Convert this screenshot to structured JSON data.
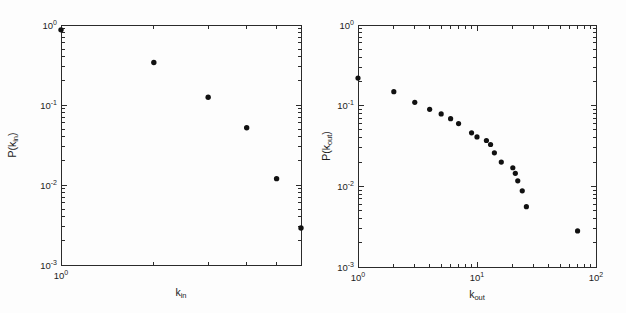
{
  "page": {
    "background": "#fdfdfd",
    "axis_color": "#2b2b2b",
    "text_color": "#1c1c1c"
  },
  "chart_data": [
    {
      "type": "scatter",
      "title": "",
      "xlabel": {
        "base": "k",
        "sub": "in"
      },
      "ylabel": {
        "pre": "P(k",
        "sub": "in",
        "post": ")"
      },
      "xscale": "log",
      "yscale": "log",
      "xlim": [
        1,
        6
      ],
      "ylim": [
        0.001,
        1
      ],
      "xtick_exponents": [
        0
      ],
      "ytick_exponents": [
        0,
        -1,
        -2,
        -3
      ],
      "grid": false,
      "legend": null,
      "marker": {
        "shape": "circle",
        "color": "#111111",
        "radius": 2.7
      },
      "x": [
        1,
        2,
        3,
        4,
        5,
        6
      ],
      "y": [
        0.87,
        0.34,
        0.125,
        0.052,
        0.012,
        0.0029
      ]
    },
    {
      "type": "scatter",
      "title": "",
      "xlabel": {
        "base": "k",
        "sub": "out"
      },
      "ylabel": {
        "pre": "P(k",
        "sub": "out",
        "post": ")"
      },
      "xscale": "log",
      "yscale": "log",
      "xlim": [
        1,
        100
      ],
      "ylim": [
        0.001,
        1
      ],
      "xtick_exponents": [
        0,
        1,
        2
      ],
      "ytick_exponents": [
        0,
        -1,
        -2,
        -3
      ],
      "grid": false,
      "legend": null,
      "marker": {
        "shape": "circle",
        "color": "#111111",
        "radius": 2.6
      },
      "x": [
        1,
        2,
        3,
        4,
        5,
        6,
        7,
        9,
        10,
        12,
        13,
        14,
        16,
        20,
        21,
        22,
        24,
        26,
        70
      ],
      "y": [
        0.22,
        0.149,
        0.11,
        0.09,
        0.079,
        0.069,
        0.06,
        0.046,
        0.041,
        0.037,
        0.033,
        0.026,
        0.02,
        0.017,
        0.0145,
        0.0117,
        0.0088,
        0.0056,
        0.0028
      ]
    }
  ]
}
